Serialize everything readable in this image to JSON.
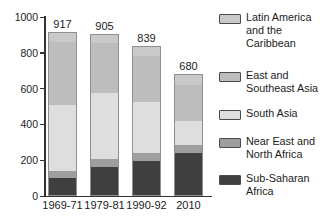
{
  "chart_data": {
    "type": "bar",
    "variant": "stacked",
    "title": "",
    "xlabel": "",
    "ylabel": "",
    "ylim": [
      0,
      1000
    ],
    "yticks": [
      0,
      200,
      400,
      600,
      800,
      1000
    ],
    "grid": false,
    "legend_position": "right",
    "categories": [
      "1969-71",
      "1979-81",
      "1990-92",
      "2010"
    ],
    "totals": [
      917,
      905,
      839,
      680
    ],
    "series": [
      {
        "name": "Sub-Saharan Africa",
        "color": "#3f3f3f",
        "values": [
          96,
          160,
          190,
          240
        ]
      },
      {
        "name": "Near East and North Africa",
        "color": "#9e9e9e",
        "values": [
          40,
          44,
          50,
          45
        ]
      },
      {
        "name": "South Asia",
        "color": "#dedede",
        "values": [
          372,
          375,
          288,
          135
        ]
      },
      {
        "name": "East and Southeast Asia",
        "color": "#bdbdbd",
        "values": [
          358,
          278,
          257,
          207
        ]
      },
      {
        "name": "Latin America and the Caribbean",
        "color": "#c9c9c9",
        "values": [
          51,
          48,
          54,
          53
        ]
      }
    ],
    "legend": [
      {
        "label": "Latin America and the Caribbean",
        "color": "#c9c9c9"
      },
      {
        "label": "East and Southeast Asia",
        "color": "#bdbdbd"
      },
      {
        "label": "South Asia",
        "color": "#dedede"
      },
      {
        "label": "Near East and North Africa",
        "color": "#9e9e9e"
      },
      {
        "label": "Sub-Saharan Africa",
        "color": "#3f3f3f"
      }
    ]
  }
}
